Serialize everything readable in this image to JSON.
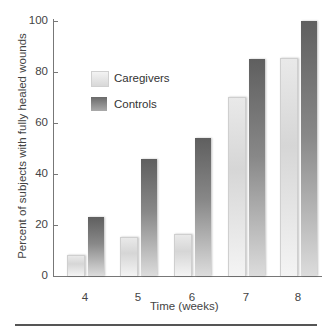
{
  "chart_data": {
    "type": "bar",
    "title": "",
    "xlabel": "Time (weeks)",
    "ylabel": "Percent of subjects with fully healed wounds",
    "categories": [
      "4",
      "5",
      "6",
      "7",
      "8"
    ],
    "series": [
      {
        "name": "Caregivers",
        "values": [
          8,
          15,
          16,
          70,
          85
        ],
        "color": "#e2e2e2"
      },
      {
        "name": "Controls",
        "values": [
          23,
          46,
          54,
          85,
          100
        ],
        "color": "#6e6e6e"
      }
    ],
    "yticks": [
      "0",
      "20",
      "40",
      "60",
      "80",
      "100"
    ],
    "ylim": [
      0,
      100
    ],
    "grid": false,
    "legend_position": "upper-left"
  },
  "legend": {
    "caregivers": "Caregivers",
    "controls": "Controls"
  }
}
